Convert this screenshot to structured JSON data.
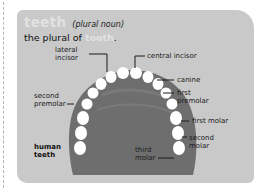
{
  "entry": {
    "headword": "teeth",
    "part_of_speech": "(plural noun)",
    "definition_prefix": "the plural of ",
    "definition_ref": "tooth",
    "definition_suffix": "."
  },
  "diagram": {
    "title": "human teeth",
    "title_line1": "human",
    "title_line2": "teeth",
    "labels": {
      "lateral_incisor_1": "lateral",
      "lateral_incisor_2": "incisor",
      "central_incisor": "central incisor",
      "canine": "canine",
      "first_premolar_1": "first",
      "first_premolar_2": "premolar",
      "second_premolar_1": "second",
      "second_premolar_2": "premolar",
      "first_molar": "first molar",
      "second_molar_1": "second",
      "second_molar_2": "molar",
      "third_molar_1": "third",
      "third_molar_2": "molar"
    },
    "colors": {
      "card": "#c9c9c9",
      "jaw": "#6e6e6e",
      "tooth": "#ffffff",
      "headword": "#e2e2e2"
    }
  }
}
